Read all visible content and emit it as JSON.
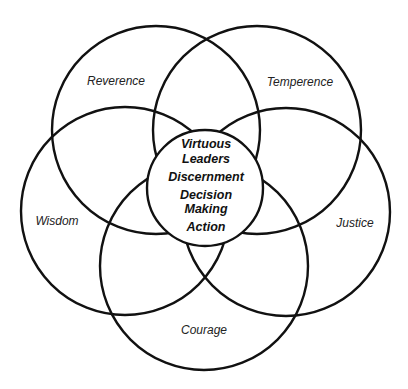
{
  "diagram": {
    "circles": [
      {
        "id": "reverence",
        "label": "Reverence",
        "cx": 156,
        "cy": 130,
        "r": 104,
        "label_x": 116,
        "label_y": 85
      },
      {
        "id": "temperence",
        "label": "Temperence",
        "cx": 257,
        "cy": 130,
        "r": 104,
        "label_x": 300,
        "label_y": 86
      },
      {
        "id": "wisdom",
        "label": "Wisdom",
        "cx": 125,
        "cy": 211,
        "r": 104,
        "label_x": 57,
        "label_y": 225
      },
      {
        "id": "justice",
        "label": "Justice",
        "cx": 286,
        "cy": 212,
        "r": 104,
        "label_x": 355,
        "label_y": 227
      },
      {
        "id": "courage",
        "label": "Courage",
        "cx": 204,
        "cy": 266,
        "r": 104,
        "label_x": 204,
        "label_y": 334
      }
    ],
    "center": {
      "cx": 205,
      "cy": 188,
      "r": 58,
      "lines": [
        "Virtuous",
        "Leaders",
        "Discernment",
        "Decision",
        "Making",
        "Action"
      ]
    },
    "stroke_color": "#111111"
  }
}
